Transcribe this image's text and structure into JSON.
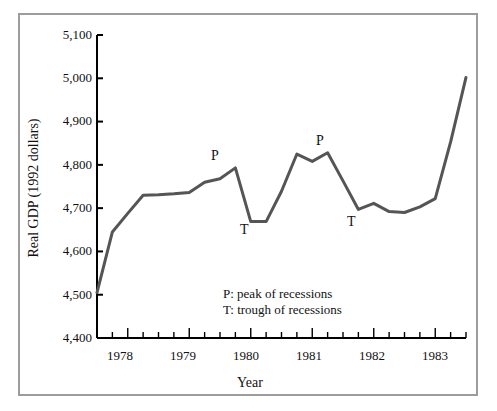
{
  "chart_data": {
    "type": "line",
    "title": "",
    "xlabel": "Year",
    "ylabel": "Real GDP (1992 dollars)",
    "ylim": [
      4400,
      5100
    ],
    "xlim": [
      1977.5,
      1983.5
    ],
    "ytick_labels": [
      "5,100",
      "5,000",
      "4,900",
      "4,800",
      "4,700",
      "4,600",
      "4,500",
      "4,400"
    ],
    "ytick_values": [
      5100,
      5000,
      4900,
      4800,
      4700,
      4600,
      4500,
      4400
    ],
    "xtick_labels": [
      "1978",
      "1979",
      "1980",
      "1981",
      "1982",
      "1983"
    ],
    "xtick_values": [
      1978,
      1979,
      1980,
      1981,
      1982,
      1983
    ],
    "minor_tick_interval_quarters": 1,
    "grid": false,
    "legend_position": "inside-center-bottom",
    "series": [
      {
        "name": "Real GDP",
        "color": "#555555",
        "x": [
          1977.5,
          1977.75,
          1978.0,
          1978.25,
          1978.5,
          1978.75,
          1979.0,
          1979.25,
          1979.5,
          1979.75,
          1980.0,
          1980.25,
          1980.5,
          1980.75,
          1981.0,
          1981.25,
          1981.5,
          1981.75,
          1982.0,
          1982.25,
          1982.5,
          1982.75,
          1983.0,
          1983.25,
          1983.5
        ],
        "y": [
          4505,
          4645,
          4688,
          4730,
          4731,
          4733,
          4736,
          4760,
          4768,
          4793,
          4669,
          4669,
          4739,
          4825,
          4808,
          4828,
          4763,
          4697,
          4711,
          4692,
          4690,
          4703,
          4722,
          4853,
          5002
        ]
      }
    ],
    "annotations": [
      {
        "label": "P",
        "x": 1979.75,
        "y": 4793,
        "note": "peak of recessions"
      },
      {
        "label": "T",
        "x": 1980.0,
        "y": 4669,
        "note": "trough of recessions"
      },
      {
        "label": "P",
        "x": 1981.25,
        "y": 4828,
        "note": "peak of recessions"
      },
      {
        "label": "T",
        "x": 1981.75,
        "y": 4697,
        "note": "trough of recessions"
      }
    ],
    "legend_lines": [
      "P: peak of recessions",
      "T: trough of recessions"
    ]
  },
  "axes": {
    "y_title": "Real GDP (1992 dollars)",
    "x_title": "Year",
    "y_ticks": [
      {
        "label": "5,100"
      },
      {
        "label": "5,000"
      },
      {
        "label": "4,900"
      },
      {
        "label": "4,800"
      },
      {
        "label": "4,700"
      },
      {
        "label": "4,600"
      },
      {
        "label": "4,500"
      },
      {
        "label": "4,400"
      }
    ],
    "x_ticks": [
      {
        "label": "1978"
      },
      {
        "label": "1979"
      },
      {
        "label": "1980"
      },
      {
        "label": "1981"
      },
      {
        "label": "1982"
      },
      {
        "label": "1983"
      }
    ]
  },
  "markers": {
    "peak_1": "P",
    "trough_1": "T",
    "peak_2": "P",
    "trough_2": "T"
  },
  "legend": {
    "line1": "P: peak of recessions",
    "line2": "T: trough of recessions"
  },
  "colors": {
    "line": "#555555",
    "axis": "#000000",
    "frame": "#9c9c9c",
    "text": "#111111"
  }
}
